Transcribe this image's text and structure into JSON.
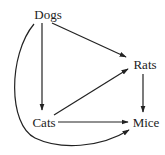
{
  "diagram": {
    "type": "directed-graph",
    "nodes": [
      {
        "id": "dogs",
        "label": "Dogs",
        "x": 52,
        "y": 15
      },
      {
        "id": "rats",
        "label": "Rats",
        "x": 145,
        "y": 65
      },
      {
        "id": "cats",
        "label": "Cats",
        "x": 44,
        "y": 122
      },
      {
        "id": "mice",
        "label": "Mice",
        "x": 145,
        "y": 122
      }
    ],
    "edges": [
      {
        "from": "Dogs",
        "to": "Cats"
      },
      {
        "from": "Dogs",
        "to": "Rats"
      },
      {
        "from": "Cats",
        "to": "Rats"
      },
      {
        "from": "Cats",
        "to": "Mice"
      },
      {
        "from": "Rats",
        "to": "Mice"
      },
      {
        "from": "Dogs",
        "to": "Mice",
        "style": "curved"
      }
    ],
    "colors": {
      "line": "#222222",
      "background": "#ffffff"
    }
  }
}
